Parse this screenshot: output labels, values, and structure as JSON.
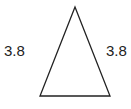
{
  "diagram": {
    "shape": "isosceles-triangle",
    "stroke_color": "#222222",
    "fill_color": "#ffffff",
    "vertices": {
      "apex": [
        75,
        7
      ],
      "base_left": [
        40,
        96
      ],
      "base_right": [
        110,
        96
      ]
    },
    "labels": {
      "left_side": "3.8",
      "right_side": "3.8"
    }
  }
}
